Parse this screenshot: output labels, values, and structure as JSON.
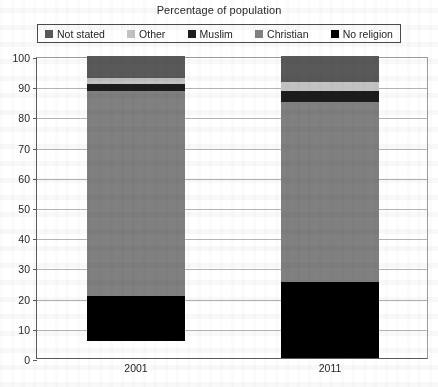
{
  "chart_data": {
    "type": "bar",
    "subtype": "stacked-column",
    "title": "Percentage of population",
    "xlabel": "",
    "ylabel": "",
    "categories": [
      "2001",
      "2011"
    ],
    "ylim": [
      0,
      100
    ],
    "yticks": [
      0,
      10,
      20,
      30,
      40,
      50,
      60,
      70,
      80,
      90,
      100
    ],
    "grid": true,
    "legend_position": "top",
    "stack_order_bottom_to_top": [
      "No religion",
      "Christian",
      "Muslim",
      "Other",
      "Not stated"
    ],
    "series": [
      {
        "name": "Not stated",
        "color": "#595959",
        "values": [
          7.3,
          8.7
        ]
      },
      {
        "name": "Other",
        "color": "#c2c2c2",
        "values": [
          2.0,
          3.0
        ]
      },
      {
        "name": "Muslim",
        "color": "#1c1c1c",
        "values": [
          2.2,
          3.5
        ]
      },
      {
        "name": "Christian",
        "color": "#808080",
        "values": [
          68.0,
          59.5
        ]
      },
      {
        "name": "No religion",
        "color": "#000000",
        "values": [
          14.8,
          25.3
        ]
      }
    ],
    "totals": [
      100,
      100
    ]
  },
  "legend": {
    "items": [
      {
        "label": "Not stated",
        "color": "#595959"
      },
      {
        "label": "Other",
        "color": "#c2c2c2"
      },
      {
        "label": "Muslim",
        "color": "#1c1c1c"
      },
      {
        "label": "Christian",
        "color": "#808080"
      },
      {
        "label": "No religion",
        "color": "#000000"
      }
    ]
  },
  "axis": {
    "y_tick_labels": [
      "100",
      "90",
      "80",
      "70",
      "60",
      "50",
      "40",
      "30",
      "20",
      "10",
      "0"
    ],
    "x_tick_labels": [
      "2001",
      "2011"
    ]
  }
}
